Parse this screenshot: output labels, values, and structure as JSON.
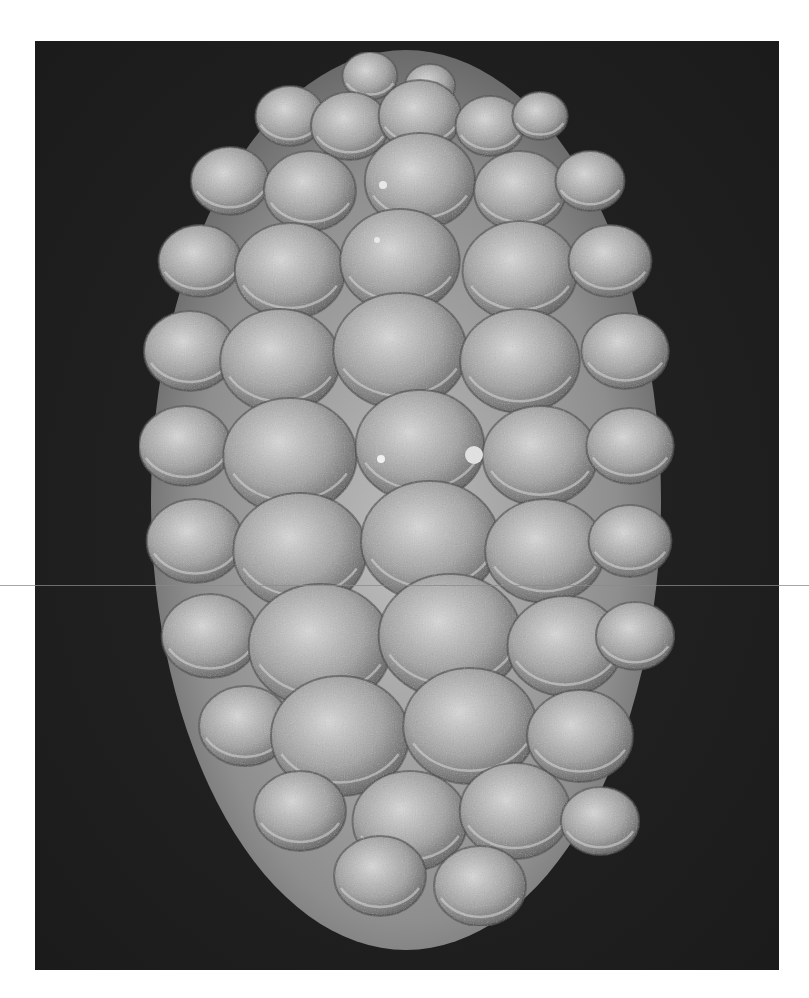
{
  "figure": {
    "type": "scanning electron micrograph",
    "orientation": "long axis vertical, narrower end at top",
    "labels": [],
    "scale_bar": null
  },
  "frame": {
    "page_background": "#ffffff",
    "image_left": 35,
    "image_top": 41,
    "image_width": 744,
    "image_height": 929,
    "background_color": "#1e1e1e",
    "scan_line_y": 585
  },
  "specimen": {
    "center_x": 406,
    "center_y": 500,
    "outline_color": "#9a9a9a",
    "body_color": "#8c8c8c",
    "highlight_color": "#d8d8d8",
    "shadow_color": "#4a4a4a",
    "cell_rows": [
      {
        "y": 80,
        "cells": [
          [
            370,
            24
          ],
          [
            430,
            22
          ]
        ]
      },
      {
        "y": 120,
        "cells": [
          [
            290,
            30
          ],
          [
            350,
            34
          ],
          [
            420,
            36
          ],
          [
            490,
            30
          ],
          [
            540,
            24
          ]
        ]
      },
      {
        "y": 185,
        "cells": [
          [
            230,
            34
          ],
          [
            310,
            40
          ],
          [
            420,
            48
          ],
          [
            520,
            40
          ],
          [
            590,
            30
          ]
        ]
      },
      {
        "y": 265,
        "cells": [
          [
            200,
            36
          ],
          [
            290,
            48
          ],
          [
            400,
            52
          ],
          [
            520,
            50
          ],
          [
            610,
            36
          ]
        ]
      },
      {
        "y": 355,
        "cells": [
          [
            190,
            40
          ],
          [
            280,
            52
          ],
          [
            400,
            58
          ],
          [
            520,
            52
          ],
          [
            625,
            38
          ]
        ]
      },
      {
        "y": 450,
        "cells": [
          [
            185,
            40
          ],
          [
            290,
            58
          ],
          [
            420,
            56
          ],
          [
            540,
            50
          ],
          [
            630,
            38
          ]
        ]
      },
      {
        "y": 545,
        "cells": [
          [
            195,
            42
          ],
          [
            300,
            58
          ],
          [
            430,
            60
          ],
          [
            545,
            52
          ],
          [
            630,
            36
          ]
        ]
      },
      {
        "y": 640,
        "cells": [
          [
            210,
            42
          ],
          [
            320,
            62
          ],
          [
            450,
            62
          ],
          [
            565,
            50
          ],
          [
            635,
            34
          ]
        ]
      },
      {
        "y": 730,
        "cells": [
          [
            245,
            40
          ],
          [
            340,
            60
          ],
          [
            470,
            58
          ],
          [
            580,
            46
          ]
        ]
      },
      {
        "y": 815,
        "cells": [
          [
            300,
            40
          ],
          [
            410,
            50
          ],
          [
            515,
            48
          ],
          [
            600,
            34
          ]
        ]
      },
      {
        "y": 880,
        "cells": [
          [
            380,
            40
          ],
          [
            480,
            40
          ]
        ]
      }
    ]
  }
}
